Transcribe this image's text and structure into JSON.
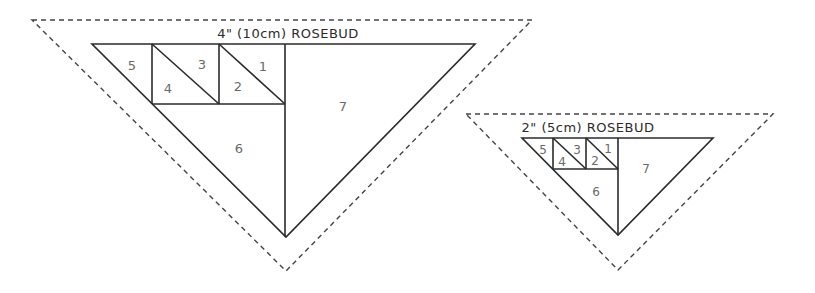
{
  "diagrams": [
    {
      "title": "4\" (10cm) ROSEBUD",
      "pieces": [
        "1",
        "2",
        "3",
        "4",
        "5",
        "6",
        "7"
      ]
    },
    {
      "title": "2\" (5cm) ROSEBUD",
      "pieces": [
        "1",
        "2",
        "3",
        "4",
        "5",
        "6",
        "7"
      ]
    }
  ],
  "colors": {
    "line": "#2b2b2b",
    "dashed_seam": "#444444",
    "numbers": "#6a6a6a"
  }
}
